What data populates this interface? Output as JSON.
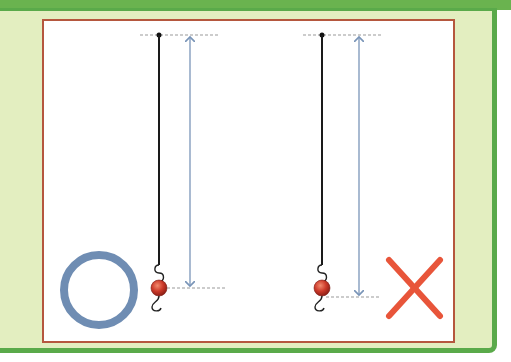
{
  "figure": {
    "correct": {
      "symbol": "circle",
      "meaning": "correct",
      "color": "#6f8db3",
      "measurement": "from pivot to center of bob"
    },
    "incorrect": {
      "symbol": "cross",
      "meaning": "incorrect",
      "color": "#e8553a",
      "measurement": "from pivot to bottom of bob"
    },
    "colors": {
      "frame_green": "#5aaa4a",
      "panel_background": "#e3eec0",
      "box_border": "#b5573e",
      "string": "#1a1a1a",
      "arrow": "#7a95b8",
      "bob": "#cc3a2a",
      "guide_line": "#999999"
    }
  }
}
